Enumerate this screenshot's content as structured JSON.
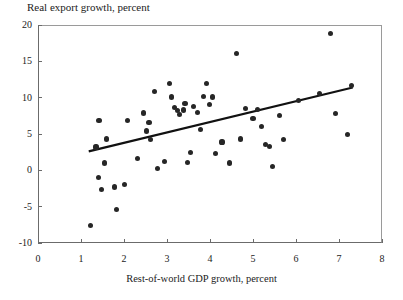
{
  "chart_data": {
    "type": "scatter",
    "title": "Real export growth, percent",
    "subtitle": "",
    "xlabel": "Rest-of-world GDP growth, percent",
    "ylabel": "Real export growth, percent",
    "xlim": [
      0,
      8
    ],
    "ylim": [
      -10,
      20
    ],
    "xticks": [
      0,
      1,
      2,
      3,
      4,
      5,
      6,
      7,
      8
    ],
    "xtick_labels": [
      "0",
      "1",
      "2",
      "3",
      "4",
      "5",
      "6",
      "7",
      "8"
    ],
    "yticks": [
      -10,
      -5,
      0,
      5,
      10,
      15,
      20
    ],
    "ytick_labels": [
      "-10",
      "-5",
      "0",
      "5",
      "10",
      "15",
      "20"
    ],
    "grid": false,
    "legend": false,
    "legend_position": "none",
    "marker": "filled-circle",
    "marker_color": "#262626",
    "series": [
      {
        "name": "Country observations",
        "points": [
          [
            1.22,
            -7.6
          ],
          [
            1.35,
            3.2
          ],
          [
            1.4,
            -1.0
          ],
          [
            1.42,
            6.9
          ],
          [
            1.48,
            -2.6
          ],
          [
            1.55,
            1.0
          ],
          [
            1.6,
            4.3
          ],
          [
            1.78,
            -2.3
          ],
          [
            1.82,
            -5.4
          ],
          [
            2.02,
            -1.9
          ],
          [
            2.08,
            6.9
          ],
          [
            2.32,
            1.6
          ],
          [
            2.45,
            7.9
          ],
          [
            2.52,
            5.4
          ],
          [
            2.58,
            6.6
          ],
          [
            2.62,
            4.2
          ],
          [
            2.7,
            10.8
          ],
          [
            2.78,
            0.3
          ],
          [
            2.95,
            1.2
          ],
          [
            3.05,
            11.9
          ],
          [
            3.1,
            10.1
          ],
          [
            3.18,
            8.7
          ],
          [
            3.25,
            8.2
          ],
          [
            3.3,
            7.7
          ],
          [
            3.38,
            8.3
          ],
          [
            3.42,
            9.2
          ],
          [
            3.48,
            1.1
          ],
          [
            3.55,
            2.4
          ],
          [
            3.62,
            8.8
          ],
          [
            3.7,
            8.0
          ],
          [
            3.78,
            5.6
          ],
          [
            3.85,
            10.2
          ],
          [
            3.92,
            11.9
          ],
          [
            3.98,
            9.1
          ],
          [
            4.05,
            10.1
          ],
          [
            4.12,
            2.3
          ],
          [
            4.28,
            3.9
          ],
          [
            4.45,
            1.0
          ],
          [
            4.62,
            16.1
          ],
          [
            4.7,
            4.3
          ],
          [
            4.82,
            8.5
          ],
          [
            5.0,
            7.1
          ],
          [
            5.1,
            8.4
          ],
          [
            5.2,
            6.0
          ],
          [
            5.3,
            3.6
          ],
          [
            5.38,
            3.3
          ],
          [
            5.45,
            0.5
          ],
          [
            5.62,
            7.5
          ],
          [
            5.7,
            4.2
          ],
          [
            6.05,
            9.6
          ],
          [
            6.55,
            10.6
          ],
          [
            6.8,
            18.8
          ],
          [
            6.92,
            7.8
          ],
          [
            7.2,
            4.9
          ],
          [
            7.3,
            11.7
          ]
        ]
      }
    ],
    "trendline": {
      "name": "Fitted regression line",
      "x_start": 1.18,
      "y_start": 2.6,
      "x_end": 7.32,
      "y_end": 11.4,
      "color": "#111111",
      "width": 2.2
    }
  }
}
